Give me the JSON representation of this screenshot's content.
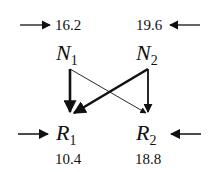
{
  "diagram": {
    "type": "bipartite-flow",
    "nodes": [
      {
        "id": "N1",
        "label": "N",
        "subscript": "1",
        "input_value": "16.2",
        "input_arrow": "from-left"
      },
      {
        "id": "N2",
        "label": "N",
        "subscript": "2",
        "input_value": "19.6",
        "input_arrow": "from-right"
      },
      {
        "id": "R1",
        "label": "R",
        "subscript": "1",
        "output_value": "10.4",
        "input_arrow": "from-left"
      },
      {
        "id": "R2",
        "label": "R",
        "subscript": "2",
        "output_value": "18.8",
        "input_arrow": "from-right"
      }
    ],
    "edges": [
      {
        "from": "N1",
        "to": "R1",
        "weight": "thick"
      },
      {
        "from": "N1",
        "to": "R2",
        "weight": "thin"
      },
      {
        "from": "N2",
        "to": "R1",
        "weight": "thick"
      },
      {
        "from": "N2",
        "to": "R2",
        "weight": "medium"
      }
    ],
    "labels": {
      "n1_value": "16.2",
      "n2_value": "19.6",
      "r1_value": "10.4",
      "r2_value": "18.8",
      "n1_letter": "N",
      "n1_sub": "1",
      "n2_letter": "N",
      "n2_sub": "2",
      "r1_letter": "R",
      "r1_sub": "1",
      "r2_letter": "R",
      "r2_sub": "2"
    },
    "colors": {
      "ink": "#111111",
      "background": "#ffffff"
    }
  }
}
